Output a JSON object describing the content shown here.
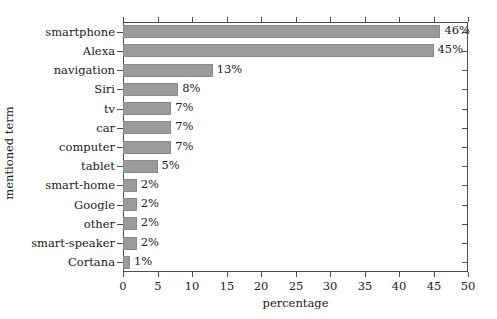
{
  "chart_data": {
    "type": "bar",
    "orientation": "horizontal",
    "title": "",
    "xlabel": "percentage",
    "ylabel": "mentioned term",
    "xlim": [
      0,
      50
    ],
    "xticks": [
      0,
      5,
      10,
      15,
      20,
      25,
      30,
      35,
      40,
      45,
      50
    ],
    "xtick_labels": [
      "0",
      "5",
      "10",
      "15",
      "20",
      "25",
      "30",
      "35",
      "40",
      "45",
      "50"
    ],
    "grid": false,
    "legend": null,
    "bar_color": "#9b9b9b",
    "bar_edge_color": "#8a8a8a",
    "background": "#ffffff",
    "categories": [
      "smartphone",
      "Alexa",
      "navigation",
      "Siri",
      "tv",
      "car",
      "computer",
      "tablet",
      "smart-home",
      "Google",
      "other",
      "smart-speaker",
      "Cortana"
    ],
    "values": [
      46,
      45,
      13,
      8,
      7,
      7,
      7,
      5,
      2,
      2,
      2,
      2,
      1
    ],
    "value_labels": [
      "46%",
      "45%",
      "13%",
      "8%",
      "7%",
      "7%",
      "7%",
      "5%",
      "2%",
      "2%",
      "2%",
      "2%",
      "1%"
    ]
  }
}
